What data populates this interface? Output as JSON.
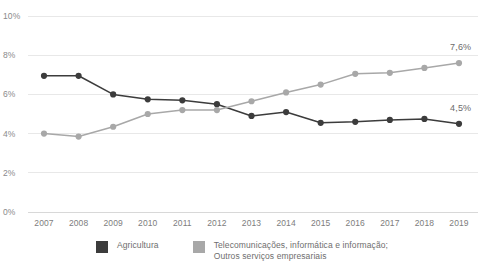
{
  "chart_data": {
    "type": "line",
    "title": "",
    "xlabel": "",
    "ylabel": "",
    "grid": true,
    "legend_position": "bottom-center",
    "ylim": [
      0,
      10
    ],
    "ytick_labels": [
      "10%",
      "8%",
      "6%",
      "4%",
      "2%",
      "0%"
    ],
    "ytick_values": [
      10,
      8,
      6,
      4,
      2,
      0
    ],
    "categories": [
      "2007",
      "2008",
      "2009",
      "2010",
      "2011",
      "2012",
      "2013",
      "2014",
      "2015",
      "2016",
      "2017",
      "2018",
      "2019"
    ],
    "series": [
      {
        "name": "Agricultura",
        "color": "#3c3c3c",
        "values": [
          6.95,
          6.95,
          6.0,
          5.75,
          5.7,
          5.5,
          4.9,
          5.1,
          4.55,
          4.6,
          4.7,
          4.75,
          4.5
        ],
        "end_label": "4,5%"
      },
      {
        "name": "Telecomunicações, informática e informação;\nOutros serviços empresariais",
        "color": "#a8a8a8",
        "values": [
          4.0,
          3.85,
          4.35,
          5.0,
          5.2,
          5.2,
          5.65,
          6.1,
          6.5,
          7.05,
          7.1,
          7.35,
          7.6
        ],
        "end_label": "7,6%"
      }
    ]
  },
  "legend": {
    "entries": [
      {
        "label": "Agricultura",
        "color": "#3c3c3c"
      },
      {
        "label": "Telecomunicações, informática e informação;\nOutros serviços empresariais",
        "color": "#a8a8a8"
      }
    ]
  }
}
